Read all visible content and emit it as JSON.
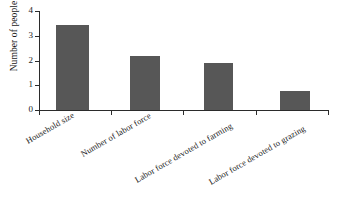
{
  "chart_data": {
    "type": "bar",
    "title": "",
    "subtitle": "",
    "xlabel": "",
    "ylabel": "Number of people",
    "categories": [
      "Household size",
      "Number of labor force",
      "Labor force devoted to farming",
      "Labor force devoted to grazing"
    ],
    "values": [
      3.45,
      2.2,
      1.9,
      0.75
    ],
    "ylim": [
      0,
      4
    ],
    "yticks": [
      0,
      1,
      2,
      3,
      4
    ],
    "ytick_labels": [
      "0",
      "1",
      "2",
      "3",
      "4"
    ],
    "grid": false,
    "legend": null,
    "legend_position": "none",
    "bar_color": "#575757",
    "axis_color": "#2b2b2b",
    "background": "#ffffff",
    "annotations": []
  }
}
